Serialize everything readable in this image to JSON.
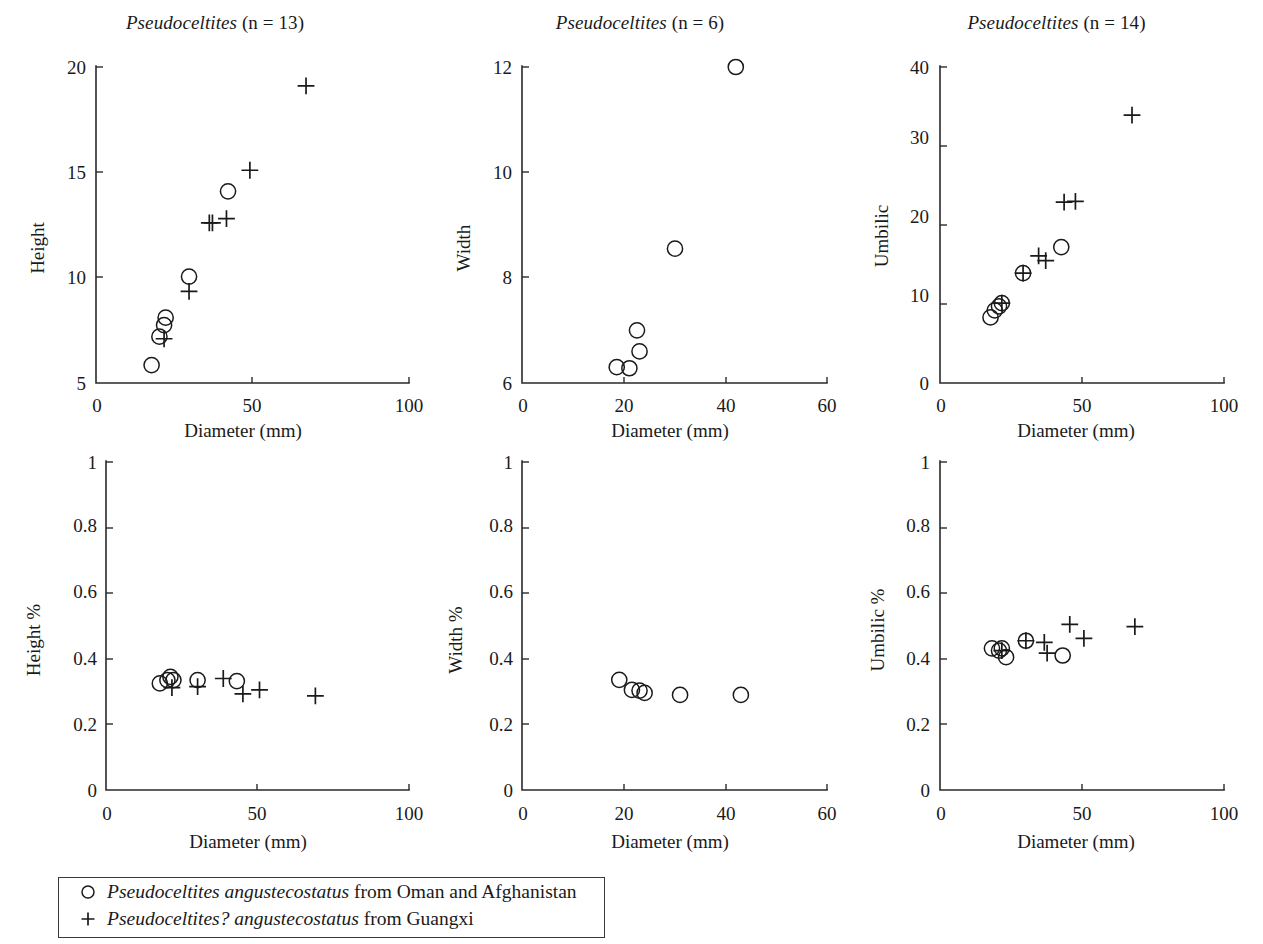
{
  "figure": {
    "background": "#ffffff",
    "ink_color": "#1a1a1a",
    "axis_xlabel": "Diameter (mm)"
  },
  "legend": {
    "entries": [
      {
        "symbol": "open-circle",
        "taxon": "Pseudoceltites angustecostatus",
        "suffix": " from Oman and Afghanistan"
      },
      {
        "symbol": "plus",
        "taxon": "Pseudoceltites? angustecostatus",
        "suffix": " from Guangxi"
      }
    ]
  },
  "chart_data": [
    {
      "id": "height-vs-diameter",
      "type": "scatter",
      "title_genus": "Pseudoceltites",
      "title_n": "(n = 13)",
      "xlabel": "Diameter (mm)",
      "ylabel": "Height",
      "xlim": [
        0,
        100
      ],
      "ylim": [
        5,
        20
      ],
      "xticks": [
        0,
        50,
        100
      ],
      "xticklabels": [
        "0",
        "50",
        "100"
      ],
      "yticks": [
        5,
        10,
        15,
        20
      ],
      "yticklabels": [
        "5",
        "10",
        "15",
        "20"
      ],
      "grid": false,
      "series": [
        {
          "name": "Pseudoceltites angustecostatus from Oman and Afghanistan",
          "marker": "open-circle",
          "points": [
            [
              17.5,
              5.85
            ],
            [
              20.0,
              7.2
            ],
            [
              21.5,
              7.75
            ],
            [
              22.0,
              8.1
            ],
            [
              29.5,
              10.05
            ],
            [
              42.0,
              14.1
            ]
          ]
        },
        {
          "name": "Pseudoceltites? angustecostatus from Guangxi",
          "marker": "plus",
          "points": [
            [
              21.5,
              7.1
            ],
            [
              29.5,
              9.35
            ],
            [
              36.0,
              12.6
            ],
            [
              37.0,
              12.6
            ],
            [
              41.5,
              12.8
            ],
            [
              49.0,
              15.1
            ],
            [
              67.0,
              19.1
            ]
          ]
        }
      ]
    },
    {
      "id": "width-vs-diameter",
      "type": "scatter",
      "title_genus": "Pseudoceltites",
      "title_n": "(n = 6)",
      "xlabel": "Diameter (mm)",
      "ylabel": "Width",
      "xlim": [
        0,
        60
      ],
      "ylim": [
        6,
        12
      ],
      "xticks": [
        0,
        20,
        40,
        60
      ],
      "xticklabels": [
        "0",
        "20",
        "40",
        "60"
      ],
      "yticks": [
        6,
        8,
        10,
        12
      ],
      "yticklabels": [
        "6",
        "8",
        "10",
        "12"
      ],
      "grid": false,
      "series": [
        {
          "name": "Pseudoceltites angustecostatus from Oman and Afghanistan",
          "marker": "open-circle",
          "points": [
            [
              18.5,
              6.3
            ],
            [
              21.0,
              6.28
            ],
            [
              22.5,
              7.0
            ],
            [
              23.0,
              6.6
            ],
            [
              30.0,
              8.55
            ],
            [
              42.0,
              12.0
            ]
          ]
        }
      ]
    },
    {
      "id": "umbilic-vs-diameter",
      "type": "scatter",
      "title_genus": "Pseudoceltites",
      "title_n": "(n = 14)",
      "xlabel": "Diameter (mm)",
      "ylabel": "Umbilic",
      "xlim": [
        0,
        100
      ],
      "ylim": [
        0,
        40
      ],
      "xticks": [
        0,
        50,
        100
      ],
      "xticklabels": [
        "0",
        "50",
        "100"
      ],
      "yticks": [
        0,
        10,
        20,
        30,
        40
      ],
      "yticklabels": [
        "0",
        "10",
        "20",
        "30",
        "40"
      ],
      "grid": false,
      "series": [
        {
          "name": "Pseudoceltites angustecostatus from Oman and Afghanistan",
          "marker": "open-circle",
          "points": [
            [
              17.5,
              8.3
            ],
            [
              19.0,
              9.2
            ],
            [
              20.5,
              9.7
            ],
            [
              21.5,
              10.1
            ],
            [
              29.0,
              13.9
            ],
            [
              42.5,
              17.2
            ]
          ]
        },
        {
          "name": "Pseudoceltites? angustecostatus from Guangxi",
          "marker": "plus",
          "points": [
            [
              21.5,
              10.1
            ],
            [
              29.0,
              13.9
            ],
            [
              34.5,
              16.1
            ],
            [
              37.0,
              15.5
            ],
            [
              43.5,
              22.9
            ],
            [
              47.5,
              23.0
            ],
            [
              67.5,
              33.9
            ]
          ]
        }
      ]
    },
    {
      "id": "height-percent-vs-diameter",
      "type": "scatter",
      "title_genus": "",
      "title_n": "",
      "xlabel": "Diameter (mm)",
      "ylabel": "Height %",
      "xlim": [
        0,
        100
      ],
      "ylim": [
        0,
        1
      ],
      "xticks": [
        0,
        50,
        100
      ],
      "xticklabels": [
        "0",
        "50",
        "100"
      ],
      "yticks": [
        0,
        0.2,
        0.4,
        0.6,
        0.8,
        1
      ],
      "yticklabels": [
        "0",
        "0.2",
        "0.4",
        "0.6",
        "0.8",
        "1"
      ],
      "grid": false,
      "series": [
        {
          "name": "Pseudoceltites angustecostatus from Oman and Afghanistan",
          "marker": "open-circle",
          "points": [
            [
              17.5,
              0.325
            ],
            [
              20.0,
              0.335
            ],
            [
              21.0,
              0.345
            ],
            [
              22.0,
              0.335
            ],
            [
              30.0,
              0.335
            ],
            [
              43.0,
              0.332
            ]
          ]
        },
        {
          "name": "Pseudoceltites? angustecostatus from Guangxi",
          "marker": "plus",
          "points": [
            [
              21.5,
              0.312
            ],
            [
              30.0,
              0.315
            ],
            [
              38.5,
              0.34
            ],
            [
              45.0,
              0.293
            ],
            [
              50.5,
              0.305
            ],
            [
              69.0,
              0.287
            ]
          ]
        }
      ]
    },
    {
      "id": "width-percent-vs-diameter",
      "type": "scatter",
      "title_genus": "",
      "title_n": "",
      "xlabel": "Diameter (mm)",
      "ylabel": "Width %",
      "xlim": [
        0,
        60
      ],
      "ylim": [
        0,
        1
      ],
      "xticks": [
        0,
        20,
        40,
        60
      ],
      "xticklabels": [
        "0",
        "20",
        "40",
        "60"
      ],
      "yticks": [
        0,
        0.2,
        0.4,
        0.6,
        0.8,
        1
      ],
      "yticklabels": [
        "0",
        "0.2",
        "0.4",
        "0.6",
        "0.8",
        "1"
      ],
      "grid": false,
      "series": [
        {
          "name": "Pseudoceltites angustecostatus from Oman and Afghanistan",
          "marker": "open-circle",
          "points": [
            [
              19.0,
              0.336
            ],
            [
              21.5,
              0.305
            ],
            [
              23.0,
              0.303
            ],
            [
              24.0,
              0.296
            ],
            [
              31.0,
              0.29
            ],
            [
              43.0,
              0.29
            ]
          ]
        }
      ]
    },
    {
      "id": "umbilic-percent-vs-diameter",
      "type": "scatter",
      "title_genus": "",
      "title_n": "",
      "xlabel": "Diameter (mm)",
      "ylabel": "Umbilic %",
      "xlim": [
        0,
        100
      ],
      "ylim": [
        0,
        1
      ],
      "xticks": [
        0,
        50,
        100
      ],
      "xticklabels": [
        "0",
        "50",
        "100"
      ],
      "yticks": [
        0,
        0.2,
        0.4,
        0.6,
        0.8,
        1
      ],
      "yticklabels": [
        "0",
        "0.2",
        "0.4",
        "0.6",
        "0.8",
        "1"
      ],
      "grid": false,
      "series": [
        {
          "name": "Pseudoceltites angustecostatus from Oman and Afghanistan",
          "marker": "open-circle",
          "points": [
            [
              18.0,
              0.432
            ],
            [
              20.5,
              0.425
            ],
            [
              21.5,
              0.432
            ],
            [
              23.0,
              0.405
            ],
            [
              30.0,
              0.455
            ],
            [
              43.0,
              0.41
            ]
          ]
        },
        {
          "name": "Pseudoceltites? angustecostatus from Guangxi",
          "marker": "plus",
          "points": [
            [
              21.5,
              0.425
            ],
            [
              30.0,
              0.455
            ],
            [
              36.5,
              0.45
            ],
            [
              37.5,
              0.417
            ],
            [
              45.5,
              0.505
            ],
            [
              50.5,
              0.462
            ],
            [
              68.5,
              0.498
            ]
          ]
        }
      ]
    }
  ]
}
